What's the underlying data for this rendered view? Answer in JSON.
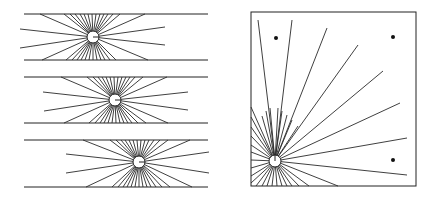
{
  "figure": {
    "width": 438,
    "height": 202,
    "ink_color": "#222222",
    "background": "#ffffff"
  },
  "left_panel": {
    "bands": [
      {
        "name": "band-1",
        "top_y": 14,
        "bottom_y": 60,
        "x_start": 24,
        "x_end": 208,
        "source": {
          "cx": 93,
          "cy": 37,
          "r": 6
        },
        "ray_ends": [
          [
            20,
            29
          ],
          [
            20,
            48
          ],
          [
            40,
            14
          ],
          [
            64,
            14
          ],
          [
            70,
            14
          ],
          [
            75,
            14
          ],
          [
            80,
            14
          ],
          [
            84,
            14
          ],
          [
            88,
            14
          ],
          [
            92,
            14
          ],
          [
            96,
            14
          ],
          [
            100,
            14
          ],
          [
            104,
            14
          ],
          [
            108,
            14
          ],
          [
            113,
            14
          ],
          [
            120,
            14
          ],
          [
            145,
            14
          ],
          [
            42,
            60
          ],
          [
            66,
            60
          ],
          [
            72,
            60
          ],
          [
            77,
            60
          ],
          [
            81,
            60
          ],
          [
            85,
            60
          ],
          [
            89,
            60
          ],
          [
            93,
            60
          ],
          [
            97,
            60
          ],
          [
            101,
            60
          ],
          [
            105,
            60
          ],
          [
            110,
            60
          ],
          [
            116,
            60
          ],
          [
            148,
            60
          ],
          [
            165,
            27
          ],
          [
            165,
            45
          ]
        ]
      },
      {
        "name": "band-2",
        "top_y": 77,
        "bottom_y": 123,
        "x_start": 24,
        "x_end": 208,
        "source": {
          "cx": 115,
          "cy": 100,
          "r": 6
        },
        "ray_ends": [
          [
            43,
            92
          ],
          [
            44,
            111
          ],
          [
            61,
            77
          ],
          [
            87,
            77
          ],
          [
            93,
            77
          ],
          [
            98,
            77
          ],
          [
            102,
            77
          ],
          [
            106,
            77
          ],
          [
            110,
            77
          ],
          [
            114,
            77
          ],
          [
            118,
            77
          ],
          [
            122,
            77
          ],
          [
            126,
            77
          ],
          [
            130,
            77
          ],
          [
            135,
            77
          ],
          [
            143,
            77
          ],
          [
            167,
            77
          ],
          [
            64,
            123
          ],
          [
            89,
            123
          ],
          [
            95,
            123
          ],
          [
            100,
            123
          ],
          [
            104,
            123
          ],
          [
            108,
            123
          ],
          [
            112,
            123
          ],
          [
            116,
            123
          ],
          [
            120,
            123
          ],
          [
            124,
            123
          ],
          [
            128,
            123
          ],
          [
            132,
            123
          ],
          [
            138,
            123
          ],
          [
            146,
            123
          ],
          [
            168,
            123
          ],
          [
            188,
            92
          ],
          [
            188,
            110
          ]
        ]
      },
      {
        "name": "band-3",
        "top_y": 140,
        "bottom_y": 187,
        "x_start": 24,
        "x_end": 208,
        "source": {
          "cx": 139,
          "cy": 162,
          "r": 6
        },
        "ray_ends": [
          [
            66,
            154
          ],
          [
            66,
            173
          ],
          [
            83,
            140
          ],
          [
            110,
            140
          ],
          [
            116,
            140
          ],
          [
            121,
            140
          ],
          [
            125,
            140
          ],
          [
            129,
            140
          ],
          [
            133,
            140
          ],
          [
            137,
            140
          ],
          [
            141,
            140
          ],
          [
            145,
            140
          ],
          [
            149,
            140
          ],
          [
            154,
            140
          ],
          [
            160,
            140
          ],
          [
            168,
            140
          ],
          [
            190,
            140
          ],
          [
            86,
            187
          ],
          [
            112,
            187
          ],
          [
            118,
            187
          ],
          [
            123,
            187
          ],
          [
            127,
            187
          ],
          [
            131,
            187
          ],
          [
            135,
            187
          ],
          [
            139,
            187
          ],
          [
            143,
            187
          ],
          [
            147,
            187
          ],
          [
            151,
            187
          ],
          [
            156,
            187
          ],
          [
            162,
            187
          ],
          [
            170,
            187
          ],
          [
            192,
            187
          ],
          [
            209,
            152
          ],
          [
            209,
            173
          ]
        ]
      }
    ]
  },
  "right_panel": {
    "box": {
      "x": 251,
      "y": 12,
      "width": 165,
      "height": 174
    },
    "source": {
      "cx": 275,
      "cy": 161,
      "r": 6
    },
    "ray_ends": [
      [
        258,
        20
      ],
      [
        292,
        20
      ],
      [
        327,
        28
      ],
      [
        358,
        45
      ],
      [
        383,
        71
      ],
      [
        400,
        103
      ],
      [
        407,
        138
      ],
      [
        407,
        175
      ],
      [
        338,
        186
      ],
      [
        251,
        107
      ],
      [
        251,
        117
      ],
      [
        251,
        127
      ],
      [
        251,
        136
      ],
      [
        251,
        145
      ],
      [
        251,
        152
      ],
      [
        251,
        160
      ],
      [
        251,
        168
      ],
      [
        251,
        176
      ],
      [
        251,
        183
      ],
      [
        256,
        186
      ],
      [
        262,
        186
      ],
      [
        267,
        186
      ],
      [
        272,
        186
      ],
      [
        277,
        186
      ],
      [
        282,
        186
      ],
      [
        287,
        186
      ],
      [
        292,
        186
      ],
      [
        299,
        186
      ],
      [
        309,
        186
      ],
      [
        262,
        116
      ],
      [
        266,
        111
      ],
      [
        270,
        108
      ],
      [
        278,
        108
      ],
      [
        282,
        111
      ],
      [
        287,
        115
      ],
      [
        292,
        120
      ],
      [
        298,
        126
      ]
    ],
    "dots": [
      {
        "cx": 276,
        "cy": 38,
        "r": 2
      },
      {
        "cx": 393,
        "cy": 37,
        "r": 2
      },
      {
        "cx": 393,
        "cy": 160,
        "r": 2
      }
    ]
  }
}
